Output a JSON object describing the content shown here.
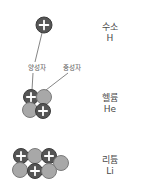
{
  "colors": {
    "proton_fill": "#555555",
    "proton_stroke": "#3c3c3c",
    "neutron_fill": "#a8a8a8",
    "neutron_stroke": "#7a7a7a",
    "plus": "#ffffff",
    "line": "#666666",
    "text": "#4a4a4a"
  },
  "labels": {
    "proton": "양성자",
    "neutron": "중성자"
  },
  "elements": [
    {
      "name_ko": "수소",
      "symbol": "H",
      "nucleus": [
        {
          "type": "proton",
          "cx": 44,
          "cy": 25,
          "r": 8
        }
      ]
    },
    {
      "name_ko": "헬륨",
      "symbol": "He",
      "nucleus": [
        {
          "type": "proton",
          "cx": 31,
          "cy": 97,
          "r": 7.5
        },
        {
          "type": "neutron",
          "cx": 44,
          "cy": 97,
          "r": 7.5
        },
        {
          "type": "neutron",
          "cx": 30,
          "cy": 110,
          "r": 7.5
        },
        {
          "type": "proton",
          "cx": 43,
          "cy": 111,
          "r": 7.5
        }
      ]
    },
    {
      "name_ko": "리튬",
      "symbol": "Li",
      "nucleus": [
        {
          "type": "proton",
          "cx": 21,
          "cy": 156,
          "r": 7.5
        },
        {
          "type": "neutron",
          "cx": 35,
          "cy": 156,
          "r": 7.5
        },
        {
          "type": "proton",
          "cx": 49,
          "cy": 156,
          "r": 7.5
        },
        {
          "type": "neutron",
          "cx": 61,
          "cy": 163,
          "r": 7.5
        },
        {
          "type": "neutron",
          "cx": 20,
          "cy": 170,
          "r": 7.5
        },
        {
          "type": "proton",
          "cx": 35,
          "cy": 171,
          "r": 7.5
        },
        {
          "type": "neutron",
          "cx": 49,
          "cy": 171,
          "r": 7.5
        }
      ]
    }
  ],
  "pointer_lines": [
    {
      "x1": 42,
      "y1": 33,
      "x2": 35,
      "y2": 62
    },
    {
      "x1": 33,
      "y1": 73,
      "x2": 32,
      "y2": 90
    },
    {
      "x1": 68,
      "y1": 73,
      "x2": 46,
      "y2": 90
    }
  ]
}
